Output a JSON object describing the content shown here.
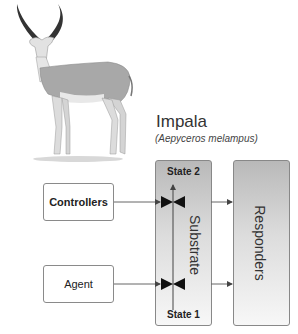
{
  "animal": {
    "name": "Impala",
    "scientific_name": "(Aepyceros melampus)",
    "illustration": "impala-illustration"
  },
  "diagram": {
    "inputs": [
      {
        "label": "Controllers",
        "bold": true
      },
      {
        "label": "Agent",
        "bold": false
      }
    ],
    "substrate": {
      "label": "Substrate",
      "top_state": "State 2",
      "bottom_state": "State 1",
      "valves": 2
    },
    "output": {
      "label": "Responders"
    },
    "colors": {
      "box_border": "#8a8a8a",
      "gradient_top": "#b9b9b9",
      "gradient_bottom": "#f7f7f7",
      "arrow": "#444444"
    }
  }
}
